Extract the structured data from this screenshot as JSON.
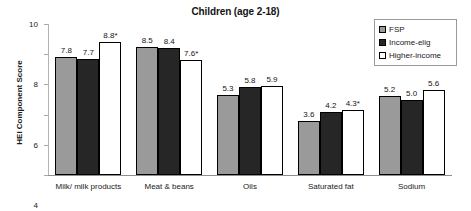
{
  "chart_data": {
    "type": "bar",
    "title": "Children (age 2-18)",
    "xlabel": "",
    "ylabel": "HEI Component Score",
    "ylim": [
      0,
      10
    ],
    "yticks": [
      0,
      2,
      4,
      6,
      8,
      10
    ],
    "grid": false,
    "legend_position": "top-right",
    "categories": [
      "Milk/ milk products",
      "Meat & beans",
      "Oils",
      "Saturated fat",
      "Sodium"
    ],
    "series": [
      {
        "name": "FSP",
        "color": "#9a9a9a",
        "values": [
          7.8,
          8.5,
          5.3,
          3.6,
          5.2
        ],
        "labels": [
          "7.8",
          "8.5",
          "5.3",
          "3.6",
          "5.2"
        ]
      },
      {
        "name": "Income-elig",
        "color": "#262626",
        "values": [
          7.7,
          8.4,
          5.8,
          4.2,
          5.0
        ],
        "labels": [
          "7.7",
          "8.4",
          "5.8",
          "4.2",
          "5.0"
        ]
      },
      {
        "name": "Higher-income",
        "color": "#ffffff",
        "values": [
          8.8,
          7.6,
          5.9,
          4.3,
          5.6
        ],
        "labels": [
          "8.8*",
          "7.6*",
          "5.9",
          "4.3*",
          "5.6"
        ]
      }
    ],
    "annotations": "* denotes statistically significant difference"
  },
  "legend": {
    "items": [
      {
        "label": "FSP"
      },
      {
        "label": "Income-elig"
      },
      {
        "label": "Higher-income"
      }
    ]
  },
  "axis": {
    "y_title": "HEI Component Score",
    "y_tick_labels": [
      "10",
      "8",
      "6",
      "4",
      "2",
      "0"
    ]
  }
}
